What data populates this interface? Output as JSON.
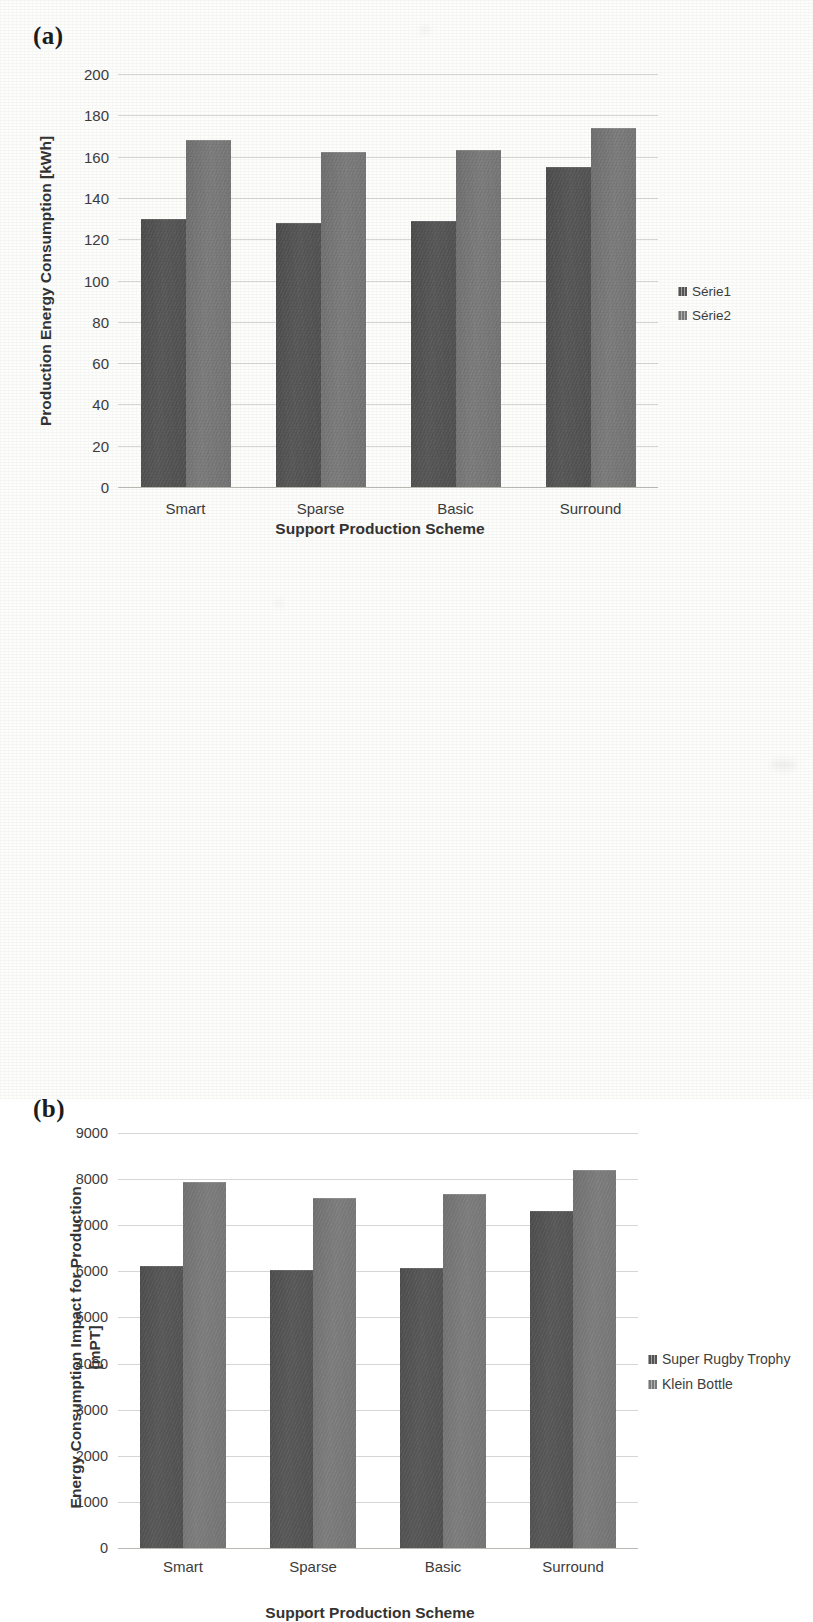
{
  "figure": {
    "panel_a_tag": "(a)",
    "panel_b_tag": "(b)"
  },
  "chart_data": [
    {
      "panel": "(a)",
      "type": "bar",
      "title": "",
      "xlabel": "Support Production Scheme",
      "ylabel": "Production Energy Consumption [kWh]",
      "categories": [
        "Smart",
        "Sparse",
        "Basic",
        "Surround"
      ],
      "series": [
        {
          "name": "Série1",
          "color": "#545454",
          "values": [
            130,
            128,
            129,
            155
          ]
        },
        {
          "name": "Série2",
          "color": "#787878",
          "values": [
            168,
            162,
            163,
            174
          ]
        }
      ],
      "ylim": [
        0,
        200
      ],
      "ytick_step": 20,
      "yticks": [
        "200",
        "180",
        "160",
        "140",
        "120",
        "100",
        "80",
        "60",
        "40",
        "20",
        "0"
      ],
      "grid": true,
      "legend_position": "right"
    },
    {
      "panel": "(b)",
      "type": "bar",
      "title": "",
      "xlabel": "Support Production Scheme",
      "ylabel": "Energy Consumption Impact for Production [mPT]",
      "ylabel_line1": "Energy Consumption Impact for Production",
      "ylabel_line2": "[mPT]",
      "categories": [
        "Smart",
        "Sparse",
        "Basic",
        "Surround"
      ],
      "series": [
        {
          "name": "Super Rugby Trophy",
          "color": "#545454",
          "values": [
            6120,
            6030,
            6080,
            7300
          ]
        },
        {
          "name": "Klein Bottle",
          "color": "#787878",
          "values": [
            7930,
            7600,
            7680,
            8200
          ]
        }
      ],
      "ylim": [
        0,
        9000
      ],
      "ytick_step": 1000,
      "yticks": [
        "9000",
        "8000",
        "7000",
        "6000",
        "5000",
        "4000",
        "3000",
        "2000",
        "1000",
        "0"
      ],
      "grid": true,
      "legend_position": "right"
    }
  ]
}
